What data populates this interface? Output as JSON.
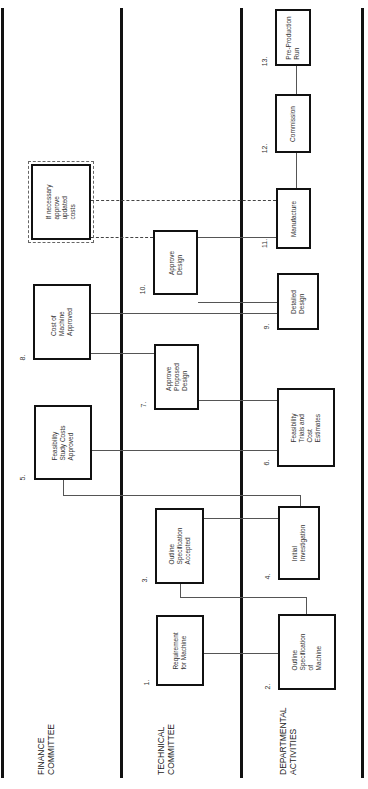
{
  "diagram": {
    "type": "swimlane-flowchart",
    "orientation": "rotated-90-ccw",
    "lanes": [
      {
        "id": "finance",
        "label": "FINANCE\nCOMMITTEE"
      },
      {
        "id": "technical",
        "label": "TECHNICAL\nCOMMITTEE"
      },
      {
        "id": "departmental",
        "label": "DEPARTMENTAL\nACTIVITIES"
      }
    ],
    "steps": [
      {
        "num": "1.",
        "lane": "technical",
        "text": "Requirement\nfor Machine"
      },
      {
        "num": "2.",
        "lane": "departmental",
        "text": "Outline\nSpecification\nof\nMachine"
      },
      {
        "num": "3.",
        "lane": "technical",
        "text": "Outline\nSpecification\nAccepted"
      },
      {
        "num": "4.",
        "lane": "departmental",
        "text": "Initial\nInvestigation"
      },
      {
        "num": "5.",
        "lane": "finance",
        "text": "Feasibility\nStudy Costs\nApproved"
      },
      {
        "num": "6.",
        "lane": "departmental",
        "text": "Feasibility\nTrials and\nCost\nEstimates"
      },
      {
        "num": "7.",
        "lane": "technical",
        "text": "Approve\nProposed\nDesign"
      },
      {
        "num": "8.",
        "lane": "finance",
        "text": "Cost of\nMachine\nApproved"
      },
      {
        "num": "9.",
        "lane": "departmental",
        "text": "Detailed\nDesign"
      },
      {
        "num": "10.",
        "lane": "technical",
        "text": "Approve\nDesign"
      },
      {
        "num": "11.",
        "lane": "departmental",
        "text": "Manufacture"
      },
      {
        "num": "12.",
        "lane": "departmental",
        "text": "Commission"
      },
      {
        "num": "13.",
        "lane": "departmental",
        "text": "Pre-Production\nRun"
      }
    ],
    "conditional": {
      "text": "If necessary\napprove\nupdated\ncosts",
      "lane": "finance",
      "style": "dashed-border"
    },
    "connections": [
      {
        "from": "1.",
        "to": "2.",
        "style": "solid"
      },
      {
        "from": "2.",
        "to": "3.",
        "style": "solid"
      },
      {
        "from": "3.",
        "to": "4.",
        "style": "solid"
      },
      {
        "from": "4.",
        "to": "5.",
        "style": "solid"
      },
      {
        "from": "5.",
        "to": "6.",
        "style": "solid"
      },
      {
        "from": "6.",
        "to": "7.",
        "style": "solid"
      },
      {
        "from": "7.",
        "to": "8.",
        "style": "solid"
      },
      {
        "from": "8.",
        "to": "9.",
        "style": "solid"
      },
      {
        "from": "9.",
        "to": "10.",
        "style": "solid"
      },
      {
        "from": "10.",
        "to": "11.",
        "style": "solid"
      },
      {
        "from": "11.",
        "to": "12.",
        "style": "solid"
      },
      {
        "from": "12.",
        "to": "13.",
        "style": "solid"
      },
      {
        "from": "conditional",
        "to": "10.",
        "style": "dashed"
      },
      {
        "from": "conditional",
        "to": "11.",
        "style": "dashed"
      }
    ]
  }
}
